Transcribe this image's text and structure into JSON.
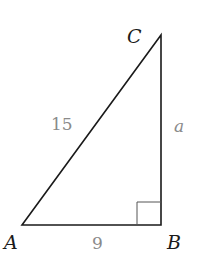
{
  "figure": {
    "type": "right-triangle",
    "vertices": {
      "A": {
        "label": "A",
        "x": 22,
        "y": 225
      },
      "B": {
        "label": "B",
        "x": 161,
        "y": 225
      },
      "C": {
        "label": "C",
        "x": 161,
        "y": 35
      }
    },
    "sides": {
      "hypotenuse_AC": {
        "label": "15"
      },
      "leg_AB": {
        "label": "9"
      },
      "leg_BC": {
        "label": "a"
      }
    },
    "right_angle_at": "B",
    "colors": {
      "line": "#1a1a1a",
      "vertex_label": "#1a1a1a",
      "side_label": "#8a8a8a",
      "right_angle_marker": "#555555"
    }
  }
}
